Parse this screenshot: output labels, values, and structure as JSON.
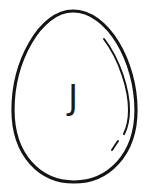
{
  "illustration": {
    "subject": "egg",
    "icon": "egg-icon",
    "letter": "J",
    "stroke_color": "#141414",
    "background_color": "#ffffff"
  }
}
